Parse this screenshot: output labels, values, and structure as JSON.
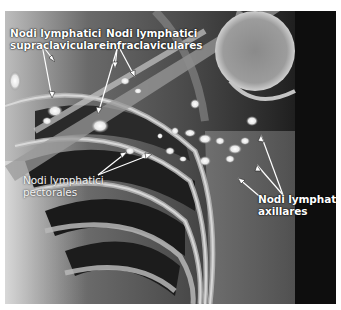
{
  "figure": {
    "type": "radiograph",
    "colors": {
      "background": "#ffffff",
      "xray_dark": "#141414",
      "bone": "#d8d8d8",
      "label": "#ffffff"
    }
  },
  "labels": [
    {
      "id": "supraclavicular",
      "line1": "Nodi lymphatici",
      "line2": "supraclaviculares"
    },
    {
      "id": "infraclavicular",
      "line1": "Nodi lymphatici",
      "line2": "infraclaviculares"
    },
    {
      "id": "pectoral",
      "line1": "Nodi lymphatici",
      "line2": "pectorales"
    },
    {
      "id": "axillary",
      "line1": "Nodi lymphatici",
      "line2": "axillares"
    }
  ]
}
